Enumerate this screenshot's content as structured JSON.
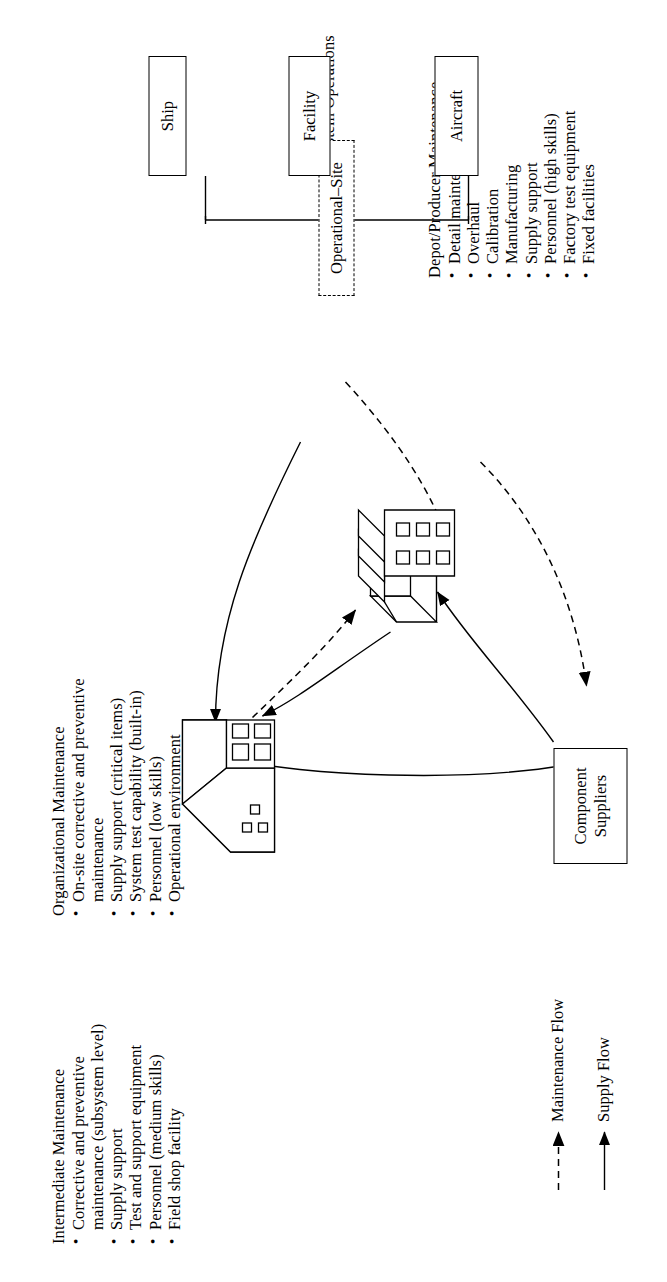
{
  "figure": {
    "title_hidden": "",
    "system_operations": {
      "label": "System Operations",
      "node_label": "Operational–Site",
      "children": [
        {
          "label": "Aircraft"
        },
        {
          "label": "Facility"
        },
        {
          "label": "Ship"
        }
      ]
    },
    "organizational": {
      "heading": "Organizational Maintenance",
      "items": [
        "On-site corrective and preventive",
        "maintenance",
        "Supply support (critical items)",
        "System test capability (built-in)",
        "Personnel (low skills)",
        "Operational environment"
      ],
      "bulleted": [
        true,
        false,
        true,
        true,
        true,
        true
      ]
    },
    "intermediate": {
      "heading": "Intermediate Maintenance",
      "items": [
        "Corrective and preventive",
        "maintenance (subsystem level)",
        "Supply support",
        "Test and support equipment",
        "Personnel (medium skills)",
        "Field shop facility"
      ],
      "bulleted": [
        true,
        false,
        true,
        true,
        true,
        true
      ]
    },
    "depot": {
      "heading": "Depot/Producer Maintenance",
      "items": [
        "Detail maintenance",
        "Overhaul",
        "Calibration",
        "Manufacturing",
        "Supply support",
        "Personnel (high skills)",
        "Factory test equipment",
        "Fixed facilities"
      ],
      "bulleted": [
        true,
        true,
        true,
        true,
        true,
        true,
        true,
        true
      ]
    },
    "component_suppliers": {
      "line1": "Component",
      "line2": "Suppliers"
    },
    "legend": {
      "maintenance_flow": "Maintenance Flow",
      "supply_flow": "Supply Flow"
    },
    "colors": {
      "ink": "#000000",
      "paper": "#ffffff"
    }
  }
}
